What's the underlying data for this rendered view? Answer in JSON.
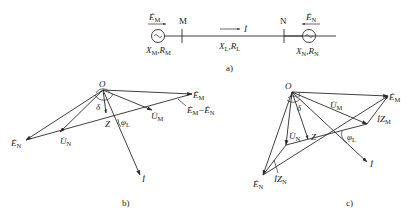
{
  "figure": {
    "panel_a": {
      "caption": "a)",
      "source_left": {
        "emf": "Ė",
        "emf_sub": "M",
        "bus": "M",
        "imp": "X",
        "imp_sub": "M",
        "res": "R",
        "res_sub": "M"
      },
      "source_right": {
        "emf": "Ė",
        "emf_sub": "N",
        "bus": "N",
        "imp": "X",
        "imp_sub": "N",
        "res": "R",
        "res_sub": "N"
      },
      "line": {
        "current": "İ",
        "imp": "X",
        "imp_sub": "L",
        "res": "R",
        "res_sub": "L"
      },
      "comma": ","
    },
    "panel_b": {
      "caption": "b)",
      "origin": "O",
      "delta": "δ",
      "phi": "φ",
      "phi_sub": "L",
      "z": "Z",
      "em": "Ė",
      "em_sub": "M",
      "en": "Ė",
      "en_sub": "N",
      "um": "U̇",
      "um_sub": "M",
      "un": "U̇",
      "un_sub": "N",
      "diff": "Ė",
      "diff_sub1": "M",
      "diff_minus": "−Ė",
      "diff_sub2": "N",
      "current": "İ"
    },
    "panel_c": {
      "caption": "c)",
      "origin": "O",
      "delta": "δ",
      "phi": "φ",
      "phi_sub": "L",
      "z": "Z",
      "em": "Ė",
      "em_sub": "M",
      "en": "Ė",
      "en_sub": "N",
      "um": "U̇",
      "um_sub": "M",
      "un": "U̇",
      "un_sub": "N",
      "izm": "İZ",
      "izm_sub": "M",
      "izn": "İZ",
      "izn_sub": "N",
      "current": "İ"
    }
  }
}
